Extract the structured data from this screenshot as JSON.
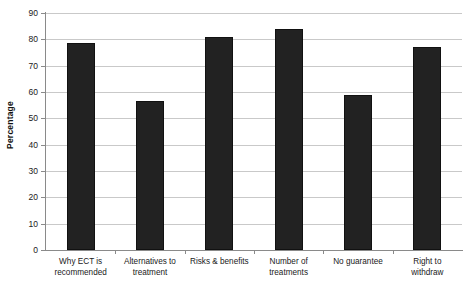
{
  "chart_data": {
    "type": "bar",
    "title": "",
    "xlabel": "",
    "ylabel": "Percentage",
    "ylim": [
      0,
      90
    ],
    "yticks": [
      0,
      10,
      20,
      30,
      40,
      50,
      60,
      70,
      80,
      90
    ],
    "grid": true,
    "legend": "none",
    "bar_color": "#222222",
    "categories": [
      "Why ECT is recommended",
      "Alternatives to treatment",
      "Risks & benefits",
      "Number of treatments",
      "No guarantee",
      "Right to withdraw"
    ],
    "category_lines": [
      [
        "Why ECT is",
        "recommended"
      ],
      [
        "Alternatives to",
        "treatment"
      ],
      [
        "Risks & benefits",
        ""
      ],
      [
        "Number of",
        "treatments"
      ],
      [
        "No guarantee",
        ""
      ],
      [
        "Right to",
        "withdraw"
      ]
    ],
    "values": [
      78.5,
      56.5,
      81,
      84,
      59,
      77
    ]
  }
}
